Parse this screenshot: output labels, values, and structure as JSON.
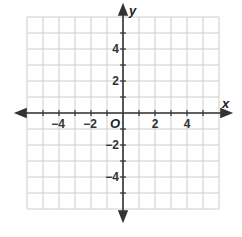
{
  "diagram": {
    "type": "coordinate-plane",
    "x_axis_label": "x",
    "y_axis_label": "y",
    "origin_label": "O",
    "x_range": [
      -6,
      6
    ],
    "y_range": [
      -6,
      6
    ],
    "grid_step": 1,
    "x_tick_labels": [
      "−4",
      "−2",
      "2",
      "4"
    ],
    "y_tick_labels": [
      "4",
      "2",
      "−2",
      "−4"
    ],
    "colors": {
      "grid": "#cccccc",
      "axis": "#333333",
      "text": "#333333"
    }
  }
}
